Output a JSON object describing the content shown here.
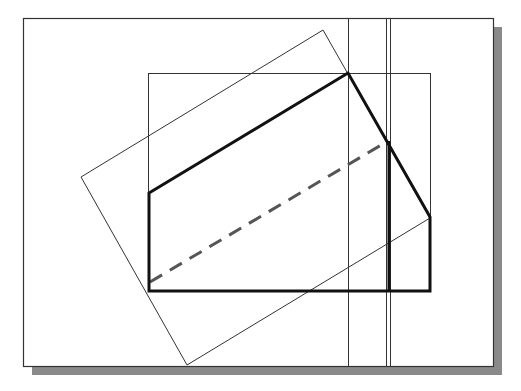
{
  "canvas": {
    "width": 521,
    "height": 391,
    "background": "#ffffff"
  },
  "colors": {
    "frame": "#333333",
    "shadow": "#8a8a8a",
    "thin_line": "#333333",
    "thick_line": "#111111",
    "dashed_line": "#555555"
  },
  "diagram": {
    "frame": {
      "x": 23,
      "y": 18,
      "width": 470,
      "height": 348
    },
    "shadow_offset": 9,
    "inner_rect": {
      "x": 148,
      "y": 73,
      "width": 282,
      "height": 218
    },
    "rotated_rect": [
      [
        81,
        177
      ],
      [
        323,
        30
      ],
      [
        430,
        218
      ],
      [
        187,
        365
      ]
    ],
    "vertical_lines": [
      {
        "x": 348
      },
      {
        "x": 386
      },
      {
        "x": 390
      }
    ],
    "thick_shape": [
      [
        149,
        193
      ],
      [
        348,
        73
      ],
      [
        430,
        217
      ],
      [
        430,
        291
      ],
      [
        149,
        291
      ]
    ],
    "thick_vertical": {
      "x": 389,
      "y1": 141,
      "y2": 291
    },
    "dashed_line": {
      "x1": 150,
      "y1": 282,
      "x2": 388,
      "y2": 141
    }
  }
}
